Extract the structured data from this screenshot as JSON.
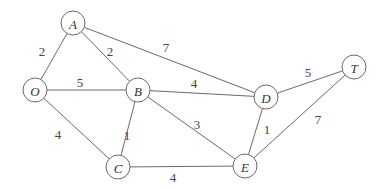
{
  "graph": {
    "nodes": [
      {
        "id": "A",
        "label": "A",
        "x": 73,
        "y": 23
      },
      {
        "id": "O",
        "label": "O",
        "x": 35,
        "y": 90
      },
      {
        "id": "B",
        "label": "B",
        "x": 138,
        "y": 90
      },
      {
        "id": "D",
        "label": "D",
        "x": 266,
        "y": 97
      },
      {
        "id": "T",
        "label": "T",
        "x": 354,
        "y": 67
      },
      {
        "id": "C",
        "label": "C",
        "x": 118,
        "y": 167
      },
      {
        "id": "E",
        "label": "E",
        "x": 245,
        "y": 166
      }
    ],
    "edges": [
      {
        "from": "O",
        "to": "A",
        "weight": "2",
        "lx": 42,
        "ly": 51
      },
      {
        "from": "A",
        "to": "B",
        "weight": "2",
        "lx": 110,
        "ly": 51
      },
      {
        "from": "A",
        "to": "D",
        "weight": "7",
        "lx": 166,
        "ly": 47
      },
      {
        "from": "O",
        "to": "B",
        "weight": "5",
        "lx": 80,
        "ly": 82
      },
      {
        "from": "B",
        "to": "D",
        "weight": "4",
        "lx": 194,
        "ly": 83
      },
      {
        "from": "D",
        "to": "T",
        "weight": "5",
        "lx": 308,
        "ly": 72
      },
      {
        "from": "O",
        "to": "C",
        "weight": "4",
        "lx": 58,
        "ly": 134
      },
      {
        "from": "B",
        "to": "C",
        "weight": "1",
        "lx": 127,
        "ly": 135
      },
      {
        "from": "B",
        "to": "E",
        "weight": "3",
        "lx": 197,
        "ly": 124
      },
      {
        "from": "D",
        "to": "E",
        "weight": "1",
        "lx": 267,
        "ly": 129
      },
      {
        "from": "T",
        "to": "E",
        "weight": "7",
        "lx": 318,
        "ly": 119
      },
      {
        "from": "C",
        "to": "E",
        "weight": "4",
        "lx": 173,
        "ly": 177
      }
    ]
  },
  "style": {
    "stroke": "#6a6a6a",
    "text": "#333333",
    "background": "#ffffff"
  }
}
